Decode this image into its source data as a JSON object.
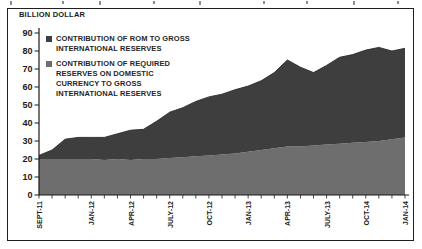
{
  "figure": {
    "axis_title": "BILLION DOLLAR",
    "frame_color": "#1f1f1f",
    "background": "#ffffff"
  },
  "legend": {
    "items": [
      {
        "name": "CONTRIBUTION OF ROM TO GROSS INTERNATIONAL RESERVES",
        "swatch_color": "#3e3e3e",
        "lines": [
          "CONTRIBUTION OF ROM TO GROSS",
          "INTERNATIONAL RESERVES"
        ]
      },
      {
        "name": "CONTRIBUTION OF REQUIRED RESERVES ON DOMESTIC CURRENCY TO GROSS INTERNATIONAL RESERVES",
        "swatch_color": "#6e6e6e",
        "lines": [
          "CONTRIBUTION OF REQUIRED",
          "RESERVES ON DOMESTIC",
          "CURRENCY TO GROSS",
          "INTERNATIONAL RESERVES"
        ]
      }
    ]
  },
  "chart_data": {
    "type": "area",
    "stacked": true,
    "title": "",
    "ylabel": "BILLION DOLLAR",
    "xlabel": "",
    "grid": false,
    "legend_position": "top-left",
    "ylim": [
      0,
      90
    ],
    "y_ticks": [
      0,
      10,
      20,
      30,
      40,
      50,
      60,
      70,
      80,
      90
    ],
    "x": [
      "SEPT-11",
      "OCT-11",
      "NOV-11",
      "DEC-11",
      "JAN-12",
      "FEB-12",
      "MAR-12",
      "APR-12",
      "MAY-12",
      "JUNE-12",
      "JULY-12",
      "AUG-12",
      "SEPT-12",
      "OCT-12",
      "NOV-12",
      "DEC-12",
      "JAN-13",
      "FEB-13",
      "MAR-13",
      "APR-13",
      "MAY-13",
      "JUNE-13",
      "JULY-13",
      "AUG-13",
      "SEPT-13",
      "OCT-13",
      "NOV-13",
      "DEC-13",
      "JAN-14"
    ],
    "x_tick_labels": [
      "SEPT-11",
      "JAN-12",
      "APR-12",
      "JULY-12",
      "OCT-12",
      "JAN-13",
      "APR-13",
      "JULY-13",
      "OCT-14",
      "JAN-14"
    ],
    "x_tick_indices": [
      0,
      4,
      7,
      10,
      13,
      16,
      19,
      22,
      25,
      28
    ],
    "series": [
      {
        "name": "CONTRIBUTION OF REQUIRED RESERVES ON DOMESTIC CURRENCY TO GROSS INTERNATIONAL RESERVES",
        "color": "#6e6e6e",
        "values": [
          20,
          20,
          20,
          20,
          20,
          19.5,
          20,
          19.5,
          20,
          20,
          20.5,
          21,
          21.5,
          22,
          22.5,
          23,
          24,
          25,
          26,
          27,
          27,
          27.5,
          28,
          28.5,
          29,
          29.5,
          30,
          31,
          32
        ]
      },
      {
        "name": "CONTRIBUTION OF ROM TO GROSS INTERNATIONAL RESERVES",
        "color": "#3e3e3e",
        "values": [
          2,
          5,
          11,
          12,
          12,
          12.5,
          14,
          16.5,
          16.5,
          21,
          25.5,
          27.5,
          30.5,
          32.5,
          33.5,
          35.5,
          36.5,
          38.5,
          42,
          48,
          44,
          40.5,
          44,
          48,
          49,
          51,
          52,
          49,
          49.5
        ]
      }
    ]
  }
}
